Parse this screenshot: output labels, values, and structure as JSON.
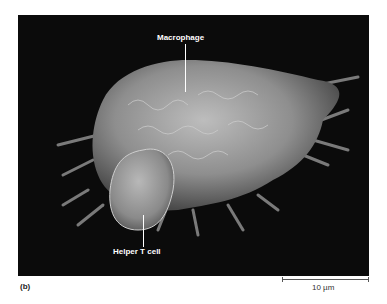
{
  "figure": {
    "panel_label": "(b)",
    "labels": {
      "macrophage": "Macrophage",
      "helper_t_cell": "Helper T cell"
    },
    "scale_bar": {
      "label": "10 µm"
    },
    "colors": {
      "background": "#0b0b0b",
      "cell": "#9a9a9a",
      "label_text": "#ffffff"
    }
  }
}
